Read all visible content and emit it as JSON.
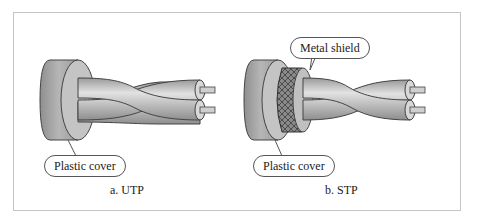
{
  "figure": {
    "panels": [
      {
        "id": "utp",
        "caption": "a. UTP",
        "callouts": [
          {
            "label": "Plastic cover"
          }
        ]
      },
      {
        "id": "stp",
        "caption": "b. STP",
        "callouts": [
          {
            "label": "Metal shield"
          },
          {
            "label": "Plastic cover"
          }
        ]
      }
    ],
    "colors": {
      "cover": "#a8a8a8",
      "cover_face": "#c9c9c9",
      "wire": "#bdbdbd",
      "shield": "#7a7a7a",
      "frame": "#c4c4c4"
    }
  }
}
